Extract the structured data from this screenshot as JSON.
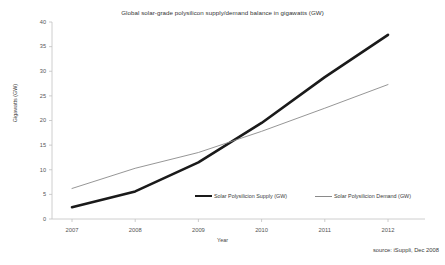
{
  "chart_data": {
    "type": "line",
    "title": "Global solar-grade polysilicon supply/demand balance in gigawatts (GW)",
    "xlabel": "Year",
    "ylabel": "Gigawatts (GW)",
    "categories": [
      "2007",
      "2008",
      "2009",
      "2010",
      "2011",
      "2012"
    ],
    "x": [
      2007,
      2008,
      2009,
      2010,
      2011,
      2012
    ],
    "series": [
      {
        "name": "Solar Polysilicion Supply (GW)",
        "values": [
          2.4,
          5.6,
          11.5,
          19.5,
          28.8,
          37.4
        ],
        "color": "#1a1a1a",
        "width": 2.6
      },
      {
        "name": "Solar Polysilicion Demand (GW)",
        "values": [
          6.2,
          10.3,
          13.5,
          17.8,
          22.5,
          27.3
        ],
        "color": "#8a8a8a",
        "width": 0.9
      }
    ],
    "ylim": [
      0,
      40
    ],
    "yticks": [
      0,
      5,
      10,
      15,
      20,
      25,
      30,
      35,
      40
    ],
    "ytick_labels": [
      "0",
      "5",
      "10",
      "15",
      "20",
      "25",
      "30",
      "35",
      "40"
    ],
    "xtick_labels": [
      "2007",
      "2008",
      "2009",
      "2010",
      "2011",
      "2012"
    ],
    "grid": false,
    "legend_position": "inside-bottom-center",
    "source": "source: iSuppli, Dec 2008",
    "background": "#ffffff",
    "axis_color": "#b0b0b0"
  },
  "legend": {
    "supply_label": "Solar Polysilicion Supply (GW)",
    "demand_label": "Solar Polysilicion Demand (GW)"
  },
  "axes": {
    "y_title": "Gigawatts (GW)",
    "x_title": "Year"
  },
  "footer": {
    "source": "source: iSuppli, Dec 2008"
  }
}
